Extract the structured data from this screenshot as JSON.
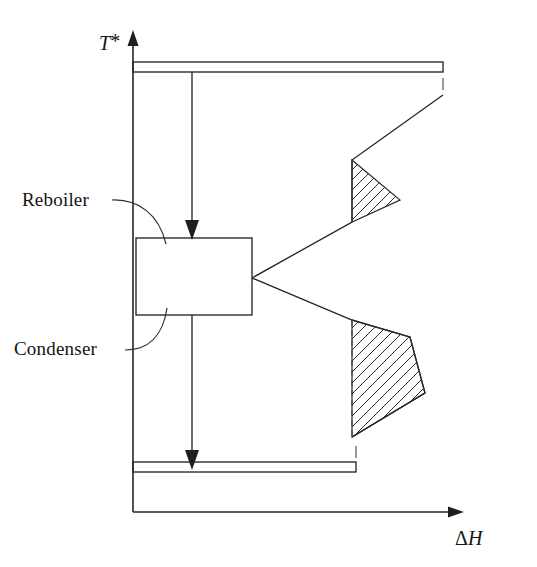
{
  "figure": {
    "background_color": "#ffffff",
    "line_color": "#262626",
    "hatch_color": "#2b2b2b"
  },
  "axes": {
    "y_label": "T*",
    "y_label_base": "T",
    "y_label_sup": "*",
    "x_label": "ΔH",
    "x_label_delta": "Δ",
    "x_label_h": "H",
    "origin": {
      "x": 133,
      "y": 512
    },
    "y_axis_top": {
      "x": 133,
      "y": 36
    },
    "x_axis_right": {
      "x": 462,
      "y": 512
    }
  },
  "labels": [
    {
      "id": "reboiler",
      "text": "Reboiler",
      "x": 22,
      "y": 205,
      "leader_from": {
        "x": 112,
        "y": 200
      },
      "leader_to": {
        "x": 158,
        "y": 240
      }
    },
    {
      "id": "condenser",
      "text": "Condenser",
      "x": 14,
      "y": 353,
      "leader_from": {
        "x": 120,
        "y": 348
      },
      "leader_to": {
        "x": 160,
        "y": 314
      }
    }
  ],
  "shapes": {
    "reboiler_condenser_box": {
      "name": "reboiler-condenser-box",
      "x": 136,
      "y": 238,
      "width": 116,
      "height": 77
    },
    "top_strip": {
      "name": "hot-utility-strip",
      "x1": 133,
      "x2": 443,
      "y_top": 62,
      "y_bottom": 72
    },
    "bottom_strip": {
      "name": "cold-utility-strip",
      "x1": 133,
      "x2": 356,
      "y_top": 462,
      "y_bottom": 472
    },
    "upper_pocket": {
      "name": "upper-hatched-pocket",
      "points": "352,160 400,200 352,222",
      "hatch_angle_deg": 45
    },
    "lower_pocket": {
      "name": "lower-hatched-pocket",
      "points": "352,320 410,337 425,393 352,437",
      "hatch_angle_deg": 45
    },
    "junction_point": {
      "x": 252,
      "y": 278
    },
    "upper_curve": "252,278 352,222 352,160 443,95",
    "lower_curve": "252,278 352,320 410,337 425,393 352,437",
    "reboiler_arrow": {
      "x": 192,
      "y_start": 72,
      "y_end": 238
    },
    "condenser_arrow": {
      "x": 192,
      "y_start": 315,
      "y_end": 468
    },
    "tick_top_right": {
      "x": 443,
      "y_start": 78,
      "y_end": 90
    },
    "tick_bottom_right": {
      "x": 356,
      "y_start": 446,
      "y_end": 458
    }
  }
}
